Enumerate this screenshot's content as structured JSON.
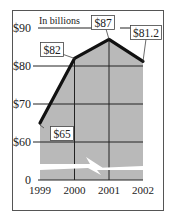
{
  "chart_data": {
    "type": "area",
    "title": "",
    "subtitle": "In billions",
    "xlabel": "",
    "ylabel": "",
    "categories": [
      "1999",
      "2000",
      "2001",
      "2002"
    ],
    "values": [
      65,
      82,
      87,
      81.2
    ],
    "data_labels": [
      "$65",
      "$82",
      "$87",
      "$81.2"
    ],
    "y_ticks": [
      0,
      60,
      70,
      80,
      90
    ],
    "y_tick_labels": [
      "0",
      "$60",
      "$70",
      "$80",
      "$90"
    ],
    "ylim": [
      0,
      90
    ],
    "axis_break": {
      "between": [
        0,
        60
      ]
    },
    "grid": true,
    "legend": null,
    "colors": {
      "area": "#b9b9b9",
      "line": "#111111",
      "grid": "#222222",
      "frame": "#444444"
    }
  }
}
